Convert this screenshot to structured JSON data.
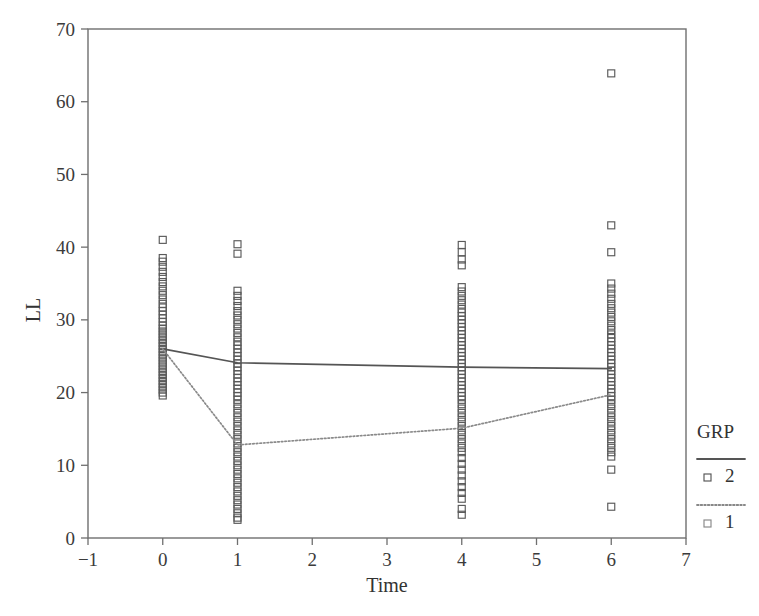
{
  "chart_data": {
    "type": "scatter",
    "title": "",
    "xlabel": "Time",
    "ylabel": "LL",
    "xlim": [
      -1,
      7
    ],
    "ylim": [
      0,
      70
    ],
    "xticks": [
      -1,
      0,
      1,
      2,
      3,
      4,
      5,
      6,
      7
    ],
    "xticklabels": [
      "−1",
      "0",
      "1",
      "2",
      "3",
      "4",
      "5",
      "6",
      "7"
    ],
    "yticks": [
      0,
      10,
      20,
      30,
      40,
      50,
      60,
      70
    ],
    "yticklabels": [
      "0",
      "10",
      "20",
      "30",
      "40",
      "50",
      "60",
      "70"
    ],
    "grid": false,
    "marker": "open-square",
    "legend": {
      "title": "GRP",
      "position": "right",
      "entries": [
        {
          "label": "2",
          "linestyle": "solid",
          "marker": "open-square",
          "color": "#555555"
        },
        {
          "label": "1",
          "linestyle": "dotted",
          "marker": "open-square",
          "color": "#888888"
        }
      ]
    },
    "series": [
      {
        "name": "GRP 2 mean",
        "linestyle": "solid",
        "color": "#555555",
        "x": [
          0,
          1,
          4,
          6
        ],
        "values": [
          26.0,
          24.1,
          23.5,
          23.3
        ]
      },
      {
        "name": "GRP 1 mean",
        "linestyle": "dotted",
        "color": "#8a8a8a",
        "x": [
          0,
          1,
          4,
          6
        ],
        "values": [
          26.0,
          12.8,
          15.1,
          19.7
        ]
      }
    ],
    "scatter_columns": [
      {
        "x": 0,
        "y": [
          41.0,
          38.5,
          38.0,
          37.3,
          36.6,
          35.9,
          35.2,
          34.6,
          34.0,
          33.4,
          32.8,
          32.2,
          31.7,
          31.2,
          30.7,
          30.2,
          29.7,
          29.2,
          28.8,
          28.4,
          28.0,
          27.6,
          27.2,
          26.8,
          26.4,
          26.0,
          25.6,
          25.2,
          24.8,
          24.4,
          24.0,
          23.6,
          23.2,
          22.8,
          22.4,
          22.0,
          21.6,
          21.2,
          20.8,
          20.4,
          20.0,
          19.6
        ]
      },
      {
        "x": 1,
        "y": [
          40.4,
          39.1,
          34.0,
          33.3,
          32.6,
          31.9,
          31.2,
          30.6,
          30.0,
          29.4,
          28.8,
          28.2,
          27.6,
          27.0,
          26.5,
          26.0,
          25.5,
          25.0,
          24.5,
          24.0,
          23.5,
          23.0,
          22.5,
          22.0,
          21.5,
          21.0,
          20.5,
          20.0,
          19.5,
          19.0,
          18.4,
          17.8,
          17.2,
          16.6,
          16.0,
          15.4,
          14.8,
          14.2,
          13.6,
          13.0,
          12.4,
          11.8,
          11.2,
          10.6,
          10.0,
          9.4,
          8.8,
          8.2,
          7.6,
          7.0,
          6.4,
          5.8,
          5.2,
          4.6,
          4.0,
          3.4,
          2.8,
          2.5
        ]
      },
      {
        "x": 4,
        "y": [
          40.3,
          39.3,
          38.3,
          37.5,
          34.5,
          33.9,
          33.3,
          32.7,
          32.1,
          31.5,
          31.0,
          30.5,
          30.0,
          29.5,
          29.0,
          28.5,
          28.0,
          27.5,
          27.0,
          26.5,
          26.0,
          25.5,
          25.0,
          24.5,
          24.0,
          23.5,
          23.0,
          22.5,
          22.0,
          21.5,
          21.0,
          20.5,
          20.0,
          19.5,
          19.0,
          18.4,
          17.8,
          17.2,
          16.6,
          16.0,
          15.4,
          14.8,
          14.2,
          13.6,
          13.0,
          12.4,
          11.8,
          11.0,
          10.2,
          9.4,
          8.6,
          7.8,
          7.0,
          6.2,
          5.4,
          4.0,
          3.2
        ]
      },
      {
        "x": 6,
        "y": [
          63.9,
          43.0,
          39.3,
          35.0,
          34.3,
          33.6,
          32.9,
          32.2,
          31.6,
          31.0,
          30.4,
          29.8,
          29.2,
          28.6,
          28.0,
          27.5,
          27.0,
          26.5,
          26.0,
          25.5,
          25.0,
          24.5,
          24.0,
          23.5,
          23.0,
          22.5,
          22.0,
          21.5,
          21.0,
          20.5,
          20.0,
          19.5,
          19.0,
          18.4,
          17.8,
          17.2,
          16.6,
          16.0,
          15.4,
          14.8,
          14.2,
          13.6,
          13.0,
          12.4,
          11.8,
          11.2,
          9.4,
          4.3
        ]
      }
    ]
  }
}
